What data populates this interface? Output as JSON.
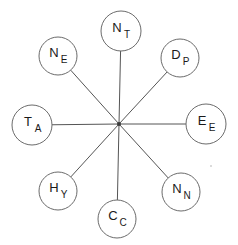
{
  "chart_data": {
    "type": "diagram",
    "title": "",
    "layout": "star / hub-and-spoke",
    "hub": {
      "label": "",
      "x": 119,
      "y": 124,
      "dot_radius": 2
    },
    "node_radius_cardinal": 20,
    "node_radius_diagonal": 19,
    "edge_color": "#555555",
    "node_stroke_color": "#6b6b6b",
    "node_fill_color": "#ffffff",
    "text_color": "#1a1a1a",
    "background_color": "#ffffff",
    "nodes": [
      {
        "id": "n-top",
        "main": "N",
        "sub": "T",
        "position": "top",
        "x": 121,
        "y": 31,
        "r": 20,
        "angle_deg": 90
      },
      {
        "id": "n-upper-right",
        "main": "D",
        "sub": "P",
        "position": "upper-right",
        "x": 180,
        "y": 58,
        "r": 19,
        "angle_deg": 45
      },
      {
        "id": "n-right",
        "main": "E",
        "sub": "E",
        "position": "right",
        "x": 206,
        "y": 124,
        "r": 20,
        "angle_deg": 0
      },
      {
        "id": "n-lower-right",
        "main": "N",
        "sub": "N",
        "position": "lower-right",
        "x": 181,
        "y": 192,
        "r": 19,
        "angle_deg": -45
      },
      {
        "id": "n-bottom",
        "main": "C",
        "sub": "C",
        "position": "bottom",
        "x": 117,
        "y": 219,
        "r": 19,
        "angle_deg": -90
      },
      {
        "id": "n-lower-left",
        "main": "H",
        "sub": "Y",
        "position": "lower-left",
        "x": 58,
        "y": 191,
        "r": 19,
        "angle_deg": -135
      },
      {
        "id": "n-left",
        "main": "T",
        "sub": "A",
        "position": "left",
        "x": 32,
        "y": 125,
        "r": 20,
        "angle_deg": 180
      },
      {
        "id": "n-upper-left",
        "main": "N",
        "sub": "E",
        "position": "upper-left",
        "x": 58,
        "y": 56,
        "r": 19,
        "angle_deg": 135
      }
    ],
    "edges": [
      {
        "from": "hub",
        "to": "n-top"
      },
      {
        "from": "hub",
        "to": "n-upper-right"
      },
      {
        "from": "hub",
        "to": "n-right"
      },
      {
        "from": "hub",
        "to": "n-lower-right"
      },
      {
        "from": "hub",
        "to": "n-bottom"
      },
      {
        "from": "hub",
        "to": "n-lower-left"
      },
      {
        "from": "hub",
        "to": "n-left"
      },
      {
        "from": "hub",
        "to": "n-upper-left"
      }
    ]
  }
}
